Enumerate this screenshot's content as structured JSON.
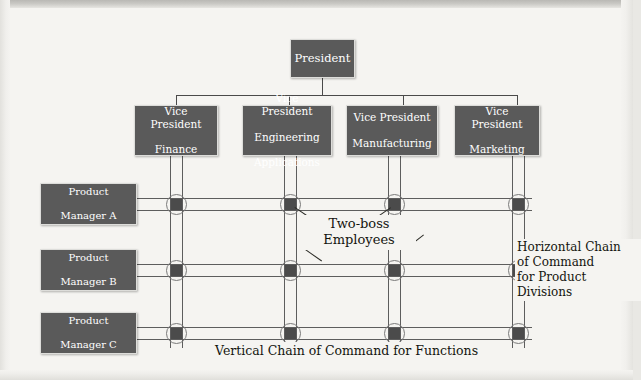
{
  "diagram": {
    "background_color": "#f5f4f1",
    "box_fill_color": "#5a5a5a",
    "box_text_color": "#ffffff",
    "line_color": "#4a4a4a",
    "node_square_color": "#4b4b4b",
    "node_circle_color": "#7a7a7a"
  },
  "president": {
    "label": "President"
  },
  "vice_presidents": [
    {
      "line1": "Vice President",
      "line2": "Finance",
      "line3": ""
    },
    {
      "line1": "Vice President",
      "line2": "Engineering",
      "line3": "Applications"
    },
    {
      "line1": "Vice President",
      "line2": "Manufacturing",
      "line3": ""
    },
    {
      "line1": "Vice President",
      "line2": "Marketing",
      "line3": ""
    }
  ],
  "product_managers": [
    {
      "line1": "Product",
      "line2": "Manager A"
    },
    {
      "line1": "Product",
      "line2": "Manager B"
    },
    {
      "line1": "Product",
      "line2": "Manager C"
    }
  ],
  "annotations": {
    "two_boss": {
      "line1": "Two-boss",
      "line2": "Employees"
    },
    "horizontal_chain": {
      "line1": "Horizontal Chain",
      "line2": "of Command",
      "line3": "for Product",
      "line4": "Divisions"
    },
    "vertical_chain": {
      "text": "Vertical Chain of Command for Functions"
    }
  },
  "nodes": {
    "count": 12,
    "rows": 3,
    "columns": 4,
    "description": "two-boss employee intersection"
  }
}
